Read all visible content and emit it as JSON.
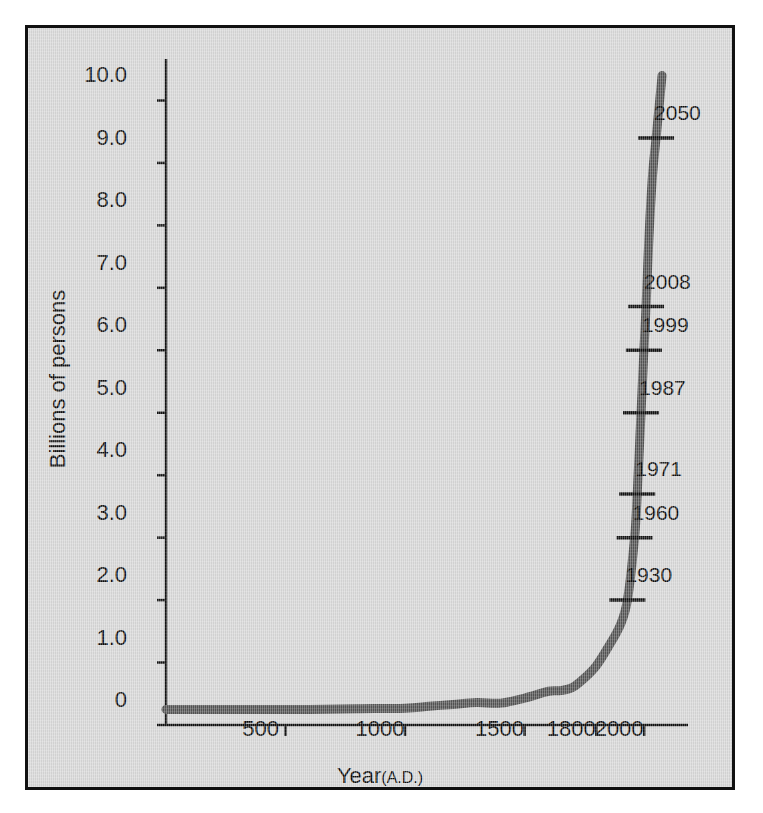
{
  "figure": {
    "background_color": "#d9d9d9",
    "border_color": "#111111",
    "curve_color": "#555555"
  },
  "chart_data": {
    "type": "line",
    "title": "",
    "xlabel_main": "Year",
    "xlabel_sub": "(A.D.)",
    "ylabel": "Billions of persons",
    "xlim": [
      0,
      2150
    ],
    "ylim": [
      0,
      10.6
    ],
    "grid": false,
    "legend": false,
    "x_ticks": [
      500,
      1000,
      1500,
      1800,
      2000
    ],
    "x_tick_labels": [
      "500",
      "1000",
      "1500",
      "1800",
      "2000"
    ],
    "y_ticks": [
      0,
      1.0,
      2.0,
      3.0,
      4.0,
      5.0,
      6.0,
      7.0,
      8.0,
      9.0,
      10.0
    ],
    "y_tick_labels": [
      "0",
      "1.0",
      "2.0",
      "3.0",
      "4.0",
      "5.0",
      "6.0",
      "7.0",
      "8.0",
      "9.0",
      "10.0"
    ],
    "series": [
      {
        "name": "World population",
        "x": [
          0,
          200,
          400,
          600,
          800,
          1000,
          1100,
          1200,
          1300,
          1400,
          1500,
          1600,
          1650,
          1700,
          1750,
          1800,
          1850,
          1900,
          1930,
          1960,
          1971,
          1987,
          1999,
          2008,
          2020,
          2035,
          2050,
          2075
        ],
        "y": [
          0.25,
          0.25,
          0.25,
          0.25,
          0.26,
          0.27,
          0.3,
          0.33,
          0.36,
          0.35,
          0.43,
          0.54,
          0.55,
          0.6,
          0.75,
          0.95,
          1.25,
          1.6,
          2.0,
          3.0,
          3.7,
          5.0,
          6.0,
          6.7,
          7.8,
          8.8,
          9.4,
          10.4
        ]
      }
    ],
    "annotations": [
      {
        "label": "1930",
        "year": 1930,
        "value": 2.0
      },
      {
        "label": "1960",
        "year": 1960,
        "value": 3.0
      },
      {
        "label": "1971",
        "year": 1971,
        "value": 3.7
      },
      {
        "label": "1987",
        "year": 1987,
        "value": 5.0
      },
      {
        "label": "1999",
        "year": 1999,
        "value": 6.0
      },
      {
        "label": "2008",
        "year": 2008,
        "value": 6.7
      },
      {
        "label": "2050",
        "year": 2050,
        "value": 9.4
      }
    ]
  }
}
